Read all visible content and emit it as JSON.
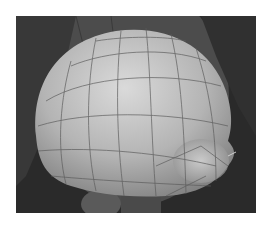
{
  "image": {
    "subject": "3D helmet dome mesh with wireframe in viewport",
    "colors": {
      "page_background": "#ffffff",
      "viewport_background": "#2a2a2a",
      "backdrop_shape": "#4a4a4a",
      "backdrop_ellipse": "#5e5e5e",
      "mesh_light": "#d8d8d8",
      "mesh_mid": "#a8a8a8",
      "mesh_dark": "#6e6e6e",
      "wire": "#555555"
    }
  }
}
